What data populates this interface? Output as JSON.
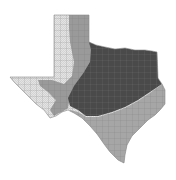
{
  "map": {
    "subject": "Texas county map with shaded regions",
    "colors": {
      "background": "#ffffff",
      "zone_light": "#e4e4e4",
      "zone_medium": "#9a9a9a",
      "zone_dark": "#4a4a4a",
      "zone_coastal": "#a6a6a6",
      "county_lines": "#7a7a7a"
    },
    "zones": [
      {
        "id": "west-light",
        "shade": "light"
      },
      {
        "id": "panhandle-medium",
        "shade": "medium"
      },
      {
        "id": "trans-pecos-medium",
        "shade": "medium"
      },
      {
        "id": "central-north-dark",
        "shade": "dark"
      },
      {
        "id": "south-coastal-medium",
        "shade": "medium"
      }
    ]
  }
}
